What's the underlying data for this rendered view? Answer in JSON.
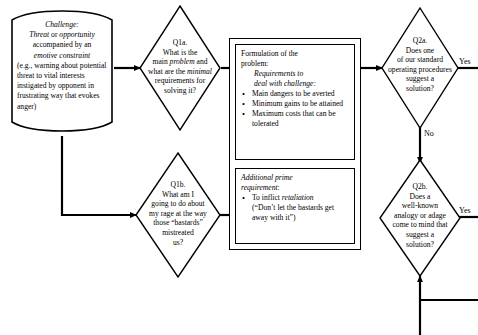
{
  "diagram": {
    "nodes": {
      "challenge": {
        "shape": "document",
        "heading": "Challenge",
        "heading_suffix": ":",
        "line1_a": "Threat",
        "line1_b": " or ",
        "line1_c": "opportunity",
        "line2": "accompanied by an",
        "line3_em": "emotive constraint",
        "body": "(e.g., warning about potential threat to vital interests instigated by opponent in frustrating way that evokes anger)"
      },
      "q1a": {
        "shape": "diamond",
        "tag": "Q1a.",
        "l1": "What is the",
        "l2_a": "main ",
        "l2_em": "problem",
        "l2_b": " and",
        "l3_a": "what are the ",
        "l3_em": "minimal",
        "l4": "requirements for",
        "l5": "solving it?"
      },
      "q1b": {
        "shape": "diamond",
        "tag": "Q1b.",
        "l1": "What am I",
        "l2": "going to do about",
        "l3": "my rage at the way",
        "l4": "those “bastards”",
        "l5": "mistreated",
        "l6": "us?"
      },
      "formulation": {
        "shape": "rect",
        "title_l1": "Formulation of the",
        "title_l2": "problem:",
        "sub_l1": "Requirements to",
        "sub_l2": "deal with challenge:",
        "bullets": [
          "Main dangers to be averted",
          "Minimum gains to be attained",
          "Maximum costs that can be tolerated"
        ]
      },
      "additional": {
        "shape": "rect",
        "title_l1": "Additional prime",
        "title_l2": "requirement",
        "title_suffix": ":",
        "bullet_pre": "To inflict ",
        "bullet_em": "retaliation",
        "bullet_post": "(“Don’t let the bastards get away with it”)"
      },
      "q2a": {
        "shape": "diamond",
        "tag": "Q2a.",
        "l1": "Does one",
        "l2": "of our standard",
        "l3": "operating procedures",
        "l4": "suggest a",
        "l5": "solution?"
      },
      "q2b": {
        "shape": "diamond",
        "tag": "Q2b.",
        "l1": "Does a",
        "l2": "well-known",
        "l3": "analogy or adage",
        "l4": "come to mind that",
        "l5": "suggest a",
        "l6": "solution?"
      }
    },
    "edge_labels": {
      "q2a_yes": "Yes",
      "q2a_no": "No",
      "q2b_yes": "Yes"
    },
    "colors": {
      "stroke": "#000000",
      "background": "#ffffff",
      "text": "#000000"
    }
  }
}
